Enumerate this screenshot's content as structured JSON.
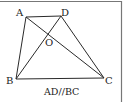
{
  "diagram": {
    "type": "geometry-trapezoid",
    "caption": "AD//BC",
    "points": {
      "A": {
        "label": "A",
        "x": 26,
        "y": 17
      },
      "D": {
        "label": "D",
        "x": 61,
        "y": 16
      },
      "B": {
        "label": "B",
        "x": 16,
        "y": 79
      },
      "C": {
        "label": "C",
        "x": 104,
        "y": 78
      },
      "O": {
        "label": "O",
        "x": 49,
        "y": 33
      }
    },
    "segments": [
      "AD",
      "AB",
      "BC",
      "DC",
      "AC",
      "BD"
    ],
    "colors": {
      "line": "#2a2a2a",
      "border": "#777777",
      "background": "#ffffff"
    }
  }
}
